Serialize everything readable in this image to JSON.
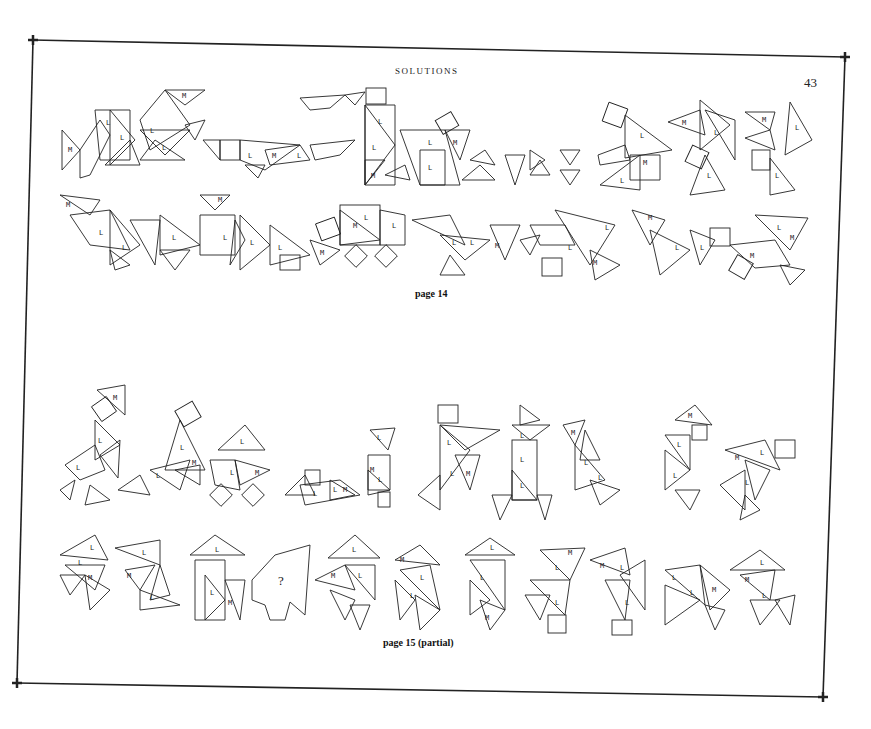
{
  "page": {
    "header": "SOLUTIONS",
    "page_number": "43",
    "sections": [
      {
        "id": "page14",
        "caption": "page 14",
        "rows": 2
      },
      {
        "id": "page15",
        "caption": "page 15 (partial)",
        "rows": 2
      }
    ],
    "piece_labels": [
      "L",
      "M"
    ],
    "unknown_figure_label": "?",
    "colors": {
      "ink": "#222222",
      "paper": "#ffffff"
    }
  }
}
